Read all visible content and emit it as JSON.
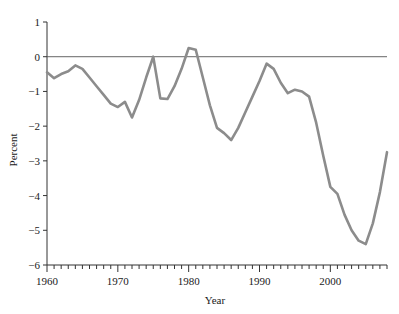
{
  "chart_data": {
    "type": "line",
    "title": "",
    "xlabel": "Year",
    "ylabel": "Percent",
    "xlim": [
      1960,
      2008
    ],
    "ylim": [
      -6,
      1
    ],
    "grid": false,
    "legend": null,
    "zero_reference_line": 0,
    "line_color": "#8c8c8c",
    "axis_color": "#333333",
    "xticks": [
      1960,
      1970,
      1980,
      1990,
      2000
    ],
    "xtick_labels": [
      "1960",
      "1970",
      "1980",
      "1990",
      "2000"
    ],
    "xminor_tick_step": 1,
    "yticks": [
      1,
      0,
      -1,
      -2,
      -3,
      -4,
      -5,
      -6
    ],
    "ytick_labels": [
      "1",
      "0",
      "−1",
      "−2",
      "−3",
      "−4",
      "−5",
      "−6"
    ],
    "series": [
      {
        "name": "Percent",
        "x": [
          1960,
          1961,
          1962,
          1963,
          1964,
          1965,
          1966,
          1967,
          1968,
          1969,
          1970,
          1971,
          1972,
          1973,
          1974,
          1975,
          1976,
          1977,
          1978,
          1979,
          1980,
          1981,
          1982,
          1983,
          1984,
          1985,
          1986,
          1987,
          1988,
          1989,
          1990,
          1991,
          1992,
          1993,
          1994,
          1995,
          1996,
          1997,
          1998,
          1999,
          2000,
          2001,
          2002,
          2003,
          2004,
          2005,
          2006,
          2007,
          2008
        ],
        "values": [
          -0.45,
          -0.62,
          -0.5,
          -0.42,
          -0.25,
          -0.35,
          -0.6,
          -0.85,
          -1.1,
          -1.35,
          -1.45,
          -1.3,
          -1.75,
          -1.25,
          -0.6,
          0.0,
          -1.2,
          -1.22,
          -0.85,
          -0.35,
          0.25,
          0.2,
          -0.6,
          -1.4,
          -2.05,
          -2.2,
          -2.4,
          -2.05,
          -1.6,
          -1.15,
          -0.7,
          -0.2,
          -0.35,
          -0.75,
          -1.05,
          -0.95,
          -1.0,
          -1.15,
          -1.9,
          -2.85,
          -3.75,
          -3.95,
          -4.55,
          -5.0,
          -5.3,
          -5.4,
          -4.8,
          -3.9,
          -2.75
        ]
      }
    ]
  },
  "axis_labels": {
    "y_title": "Percent",
    "x_title": "Year"
  }
}
